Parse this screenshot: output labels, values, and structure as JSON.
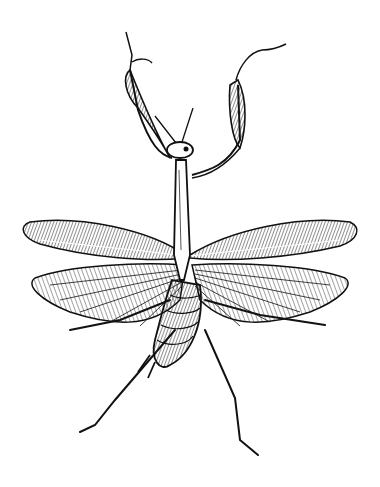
{
  "image": {
    "subject": "praying mantis engraving",
    "style": "black-and-white line engraving",
    "background": "#ffffff",
    "ink": "#111111"
  }
}
